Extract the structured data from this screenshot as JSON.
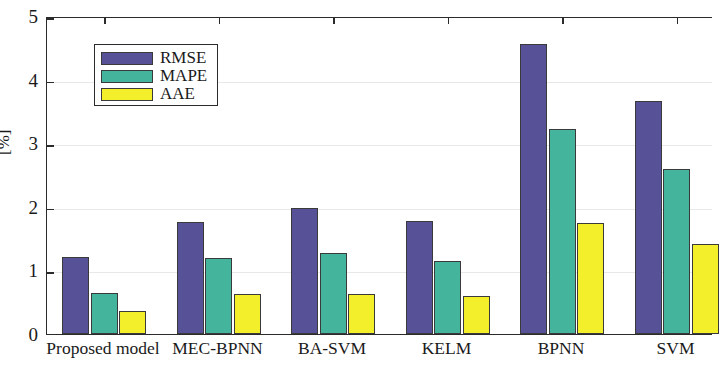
{
  "chart_data": {
    "type": "bar",
    "title": "",
    "xlabel": "",
    "ylabel": "[%]",
    "ylim": [
      0,
      5
    ],
    "yticks": [
      0,
      1,
      2,
      3,
      4,
      5
    ],
    "ytick_labels": [
      "0",
      "1",
      "2",
      "3",
      "4",
      "5"
    ],
    "grid": true,
    "legend_position": "upper left",
    "categories": [
      "Proposed model",
      "MEC-BPNN",
      "BA-SVM",
      "KELM",
      "BPNN",
      "SVM"
    ],
    "series": [
      {
        "name": "RMSE",
        "color": "#575198",
        "values": [
          1.21,
          1.76,
          1.98,
          1.78,
          4.56,
          3.66
        ]
      },
      {
        "name": "MAPE",
        "color": "#45b49c",
        "values": [
          0.64,
          1.2,
          1.27,
          1.15,
          3.22,
          2.59
        ]
      },
      {
        "name": "AAE",
        "color": "#f4ef2b",
        "values": [
          0.36,
          0.63,
          0.63,
          0.6,
          1.74,
          1.42
        ]
      }
    ]
  },
  "axes": {
    "frame_color": "#2b2b2b",
    "grid_color": "#e8e8e8",
    "text_color": "#1a1a1a"
  }
}
